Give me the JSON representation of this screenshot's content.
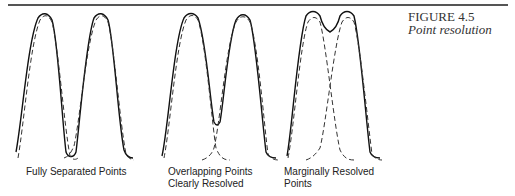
{
  "figure": {
    "number": "FIGURE 4.5",
    "title": "Point resolution"
  },
  "panels": [
    {
      "caption": [
        "Fully Separated Points"
      ]
    },
    {
      "caption": [
        "Overlapping Points",
        "Clearly Resolved"
      ]
    },
    {
      "caption": [
        "Marginally Resolved",
        "Points"
      ]
    }
  ],
  "legend": {
    "solid": "combined intensity profile",
    "dashed": "individual point profiles"
  }
}
